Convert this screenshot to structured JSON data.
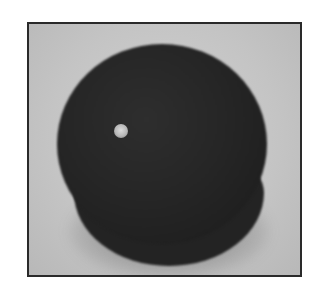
{
  "image": {
    "subject": "dark sphere with small hole",
    "frame_color": "#2a2a2a",
    "background_color": "#c8c8c8",
    "ball_color": "#222222",
    "hole_color": "#d4d4d4"
  }
}
